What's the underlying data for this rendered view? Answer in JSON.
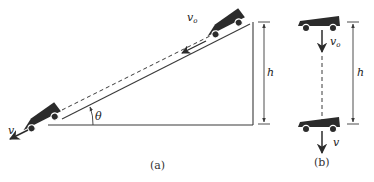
{
  "figure": {
    "panel_a": {
      "caption": "(a)",
      "labels": {
        "initial_velocity": "v",
        "initial_velocity_sub": "o",
        "final_velocity": "v",
        "angle": "θ",
        "height": "h"
      }
    },
    "panel_b": {
      "caption": "(b)",
      "labels": {
        "initial_velocity": "v",
        "initial_velocity_sub": "o",
        "final_velocity": "v",
        "height": "h"
      }
    },
    "colors": {
      "line": "#3a3a3a",
      "cart": "#2b2b2b",
      "background": "#ffffff"
    }
  }
}
